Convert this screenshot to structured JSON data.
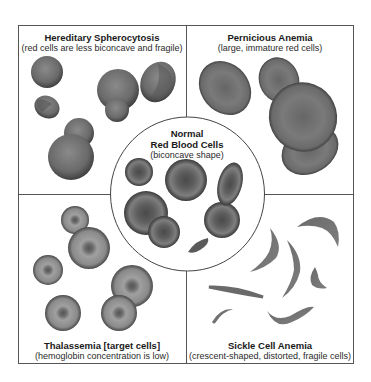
{
  "figure": {
    "panels": [
      {
        "id": "hereditary-spherocytosis",
        "title": "Hereditary Spherocytosis",
        "subtitle": "(red cells are less biconcave and fragile)"
      },
      {
        "id": "pernicious-anemia",
        "title": "Pernicious Anemia",
        "subtitle": "(large, immature red cells)"
      },
      {
        "id": "thalassemia",
        "title": "Thalassemia [target cells]",
        "subtitle": "(hemoglobin concentration is low)"
      },
      {
        "id": "sickle-cell-anemia",
        "title": "Sickle Cell Anemia",
        "subtitle": "(crescent-shaped, distorted, fragile cells)"
      }
    ],
    "center": {
      "title_line1": "Normal",
      "title_line2": "Red Blood Cells",
      "subtitle": "(biconcave shape)"
    },
    "colors": {
      "cell_dark": "#4a4a4a",
      "cell_mid": "#7a7a7a",
      "cell_light": "#9a9a9a",
      "border": "#555555",
      "background": "#ffffff"
    }
  }
}
